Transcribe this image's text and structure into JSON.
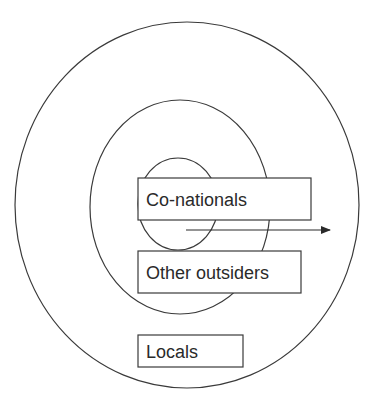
{
  "diagram": {
    "type": "nested-circles",
    "stroke_color": "#3a3a3a",
    "circles": [
      {
        "name": "outer",
        "cx": 187,
        "cy": 205,
        "rx": 172,
        "ry": 183
      },
      {
        "name": "middle",
        "cx": 180,
        "cy": 207,
        "rx": 90,
        "ry": 107
      },
      {
        "name": "inner",
        "cx": 178,
        "cy": 204,
        "rx": 40,
        "ry": 46
      }
    ],
    "labels": {
      "co_nationals": "Co-nationals",
      "other_outsiders": "Other outsiders",
      "locals": "Locals"
    },
    "arrow": {
      "x1": 186,
      "y1": 230,
      "x2": 330,
      "y2": 230
    }
  }
}
